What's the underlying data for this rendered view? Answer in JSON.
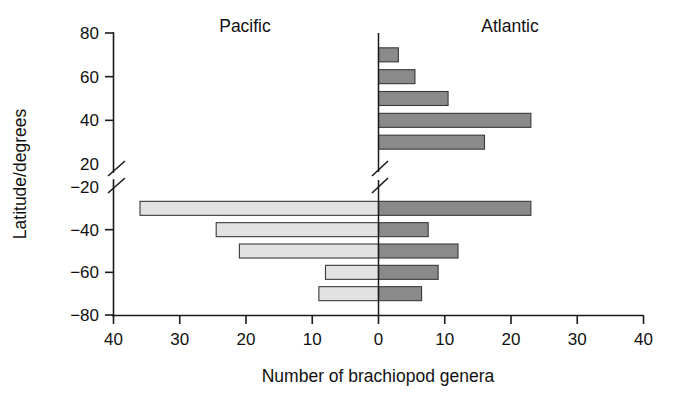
{
  "chart_data": {
    "type": "bar",
    "orientation": "horizontal",
    "subtype": "bidirectional-population-pyramid",
    "title": "",
    "xlabel": "Number of brachiopod genera",
    "ylabel": "Latitude/degrees",
    "xlim": [
      -40,
      40
    ],
    "ylim": [
      -80,
      80
    ],
    "grid": false,
    "legend_position": "inside-top (text labels above each side)",
    "axis_break": {
      "axis": "y",
      "between": [
        20,
        -20
      ],
      "note": "y-axis broken between 20 and -20 degrees"
    },
    "x_ticks": [
      "40",
      "30",
      "20",
      "10",
      "0",
      "10",
      "20",
      "30",
      "40"
    ],
    "x_tick_values": [
      -40,
      -30,
      -20,
      -10,
      0,
      10,
      20,
      30,
      40
    ],
    "y_ticks": [
      "80",
      "60",
      "40",
      "20",
      "-20",
      "-40",
      "-60",
      "-80"
    ],
    "y_tick_values": [
      80,
      60,
      40,
      20,
      -20,
      -40,
      -60,
      -80
    ],
    "categories": [
      70,
      60,
      50,
      40,
      30,
      -30,
      -40,
      -50,
      -60,
      -70
    ],
    "series": [
      {
        "name": "Pacific",
        "direction": "left",
        "color": "#e2e2e2",
        "values": [
          0,
          0,
          0,
          0,
          0,
          36,
          24.5,
          21,
          8,
          9
        ]
      },
      {
        "name": "Atlantic",
        "direction": "right",
        "color": "#8a8a8a",
        "values": [
          3,
          5.5,
          10.5,
          23,
          16,
          23,
          7.5,
          12,
          9,
          6.5
        ]
      }
    ]
  },
  "labels": {
    "pacific": "Pacific",
    "atlantic": "Atlantic",
    "xlabel": "Number of brachiopod genera",
    "ylabel": "Latitude/degrees"
  },
  "colors": {
    "pacific_fill": "#e2e2e2",
    "atlantic_fill": "#8a8a8a",
    "bar_stroke": "#3a3a3a",
    "axis": "#1a1a1a",
    "background": "#ffffff"
  }
}
